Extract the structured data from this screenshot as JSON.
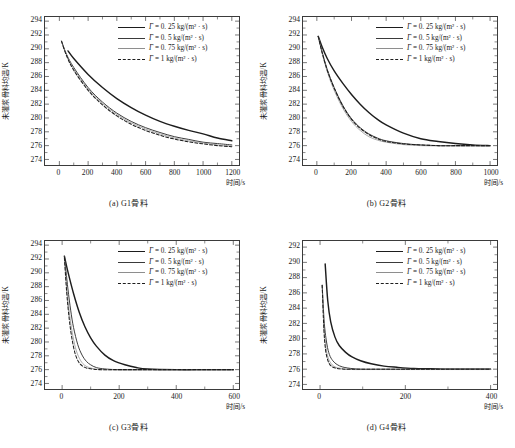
{
  "figure": {
    "y_axis_label": "未灌浆骨料均温/K",
    "x_axis_label": "时间/s",
    "legend_labels": [
      "= 0. 25 kg/(m² · s)",
      "= 0. 5 kg/(m² · s)",
      "= 0. 75 kg/(m² · s)",
      "= 1  kg/(m² · s)"
    ],
    "gamma_symbol": "Γ",
    "series_colors": [
      "#1d1d1d",
      "#3a3a3a",
      "#8e8e8e",
      "#1d1d1d"
    ]
  },
  "chart_data": [
    {
      "type": "line",
      "panel": "a",
      "caption": "(a) G1骨料",
      "xlabel": "时间/s",
      "ylabel": "未灌浆骨料均温/K",
      "xlim": [
        -100,
        1250
      ],
      "ylim": [
        273.2,
        294.6
      ],
      "xticks": [
        0,
        200,
        400,
        600,
        800,
        1000,
        1200
      ],
      "yticks": [
        274,
        276,
        278,
        280,
        282,
        284,
        286,
        288,
        290,
        292,
        294
      ],
      "grid": false,
      "legend_position": "top-right",
      "series": [
        {
          "name": "Γ = 0.25 kg/(m² · s)",
          "style": "solid-thick",
          "color": "#1d1d1d",
          "x": [
            60,
            100,
            200,
            300,
            400,
            500,
            600,
            700,
            800,
            900,
            1000,
            1100,
            1200
          ],
          "y": [
            289.7,
            288.6,
            286.3,
            284.4,
            282.8,
            281.5,
            280.4,
            279.5,
            278.8,
            278.2,
            277.7,
            277.1,
            276.7
          ]
        },
        {
          "name": "Γ = 0.5 kg/(m² · s)",
          "style": "solid-medium",
          "color": "#3a3a3a",
          "x": [
            15,
            50,
            100,
            200,
            300,
            400,
            500,
            600,
            700,
            800,
            900,
            1000,
            1100,
            1200
          ],
          "y": [
            291.1,
            289.2,
            287.3,
            284.4,
            282.3,
            280.7,
            279.5,
            278.6,
            277.9,
            277.3,
            276.9,
            276.5,
            276.3,
            276.1
          ]
        },
        {
          "name": "Γ = 0.75 kg/(m² · s)",
          "style": "solid-thin",
          "color": "#8e8e8e",
          "x": [
            15,
            50,
            100,
            200,
            300,
            400,
            500,
            600,
            700,
            800,
            900,
            1000,
            1100,
            1200
          ],
          "y": [
            291.1,
            289.1,
            287.1,
            284.2,
            282.1,
            280.5,
            279.3,
            278.4,
            277.7,
            277.1,
            276.7,
            276.4,
            276.1,
            275.95
          ]
        },
        {
          "name": "Γ = 1 kg/(m² · s)",
          "style": "dashed",
          "color": "#1d1d1d",
          "x": [
            15,
            50,
            100,
            200,
            300,
            400,
            500,
            600,
            700,
            800,
            900,
            1000,
            1100,
            1200
          ],
          "y": [
            291.1,
            289.0,
            286.9,
            284.0,
            281.9,
            280.3,
            279.1,
            278.2,
            277.5,
            276.95,
            276.55,
            276.25,
            276.0,
            275.85
          ]
        }
      ]
    },
    {
      "type": "line",
      "panel": "b",
      "caption": "(b) G2骨料",
      "xlabel": "时间/s",
      "ylabel": "未灌浆骨料均温/K",
      "xlim": [
        -80,
        1040
      ],
      "ylim": [
        273.2,
        294.6
      ],
      "xticks": [
        0,
        200,
        400,
        600,
        800,
        1000
      ],
      "yticks": [
        274,
        276,
        278,
        280,
        282,
        284,
        286,
        288,
        290,
        292,
        294
      ],
      "grid": false,
      "legend_position": "top-right",
      "series": [
        {
          "name": "Γ = 0.25 kg/(m² · s)",
          "style": "solid-thick",
          "color": "#1d1d1d",
          "x": [
            8,
            30,
            60,
            100,
            150,
            200,
            250,
            300,
            350,
            400,
            500,
            600,
            700,
            800,
            900,
            1000
          ],
          "y": [
            291.8,
            290.3,
            288.6,
            286.8,
            285.0,
            283.4,
            282.0,
            280.8,
            279.8,
            279.0,
            277.8,
            277.0,
            276.6,
            276.3,
            276.1,
            276.0
          ]
        },
        {
          "name": "Γ = 0.5 kg/(m² · s)",
          "style": "solid-medium",
          "color": "#3a3a3a",
          "x": [
            8,
            30,
            60,
            100,
            150,
            200,
            250,
            300,
            350,
            400,
            500,
            600,
            700,
            800,
            900,
            1000
          ],
          "y": [
            291.8,
            289.6,
            287.0,
            284.4,
            281.8,
            279.9,
            278.6,
            277.7,
            277.1,
            276.7,
            276.3,
            276.1,
            276.0,
            276.0,
            276.0,
            276.0
          ]
        },
        {
          "name": "Γ = 0.75 kg/(m² · s)",
          "style": "solid-thin",
          "color": "#8e8e8e",
          "x": [
            8,
            30,
            60,
            100,
            150,
            200,
            250,
            300,
            350,
            400,
            500,
            600,
            700,
            800,
            900,
            1000
          ],
          "y": [
            291.8,
            289.4,
            286.7,
            284.0,
            281.4,
            279.5,
            278.2,
            277.3,
            276.8,
            276.5,
            276.15,
            276.0,
            275.95,
            275.95,
            275.95,
            275.95
          ]
        },
        {
          "name": "Γ = 1 kg/(m² · s)",
          "style": "dashed",
          "color": "#1d1d1d",
          "x": [
            8,
            30,
            60,
            100,
            150,
            200,
            250,
            300,
            350,
            400,
            500,
            600,
            700,
            800,
            900,
            1000
          ],
          "y": [
            291.8,
            289.5,
            286.9,
            284.3,
            281.7,
            279.8,
            278.5,
            277.6,
            277.0,
            276.6,
            276.25,
            276.1,
            276.0,
            276.0,
            276.0,
            276.0
          ]
        }
      ]
    },
    {
      "type": "line",
      "panel": "c",
      "caption": "(c) G3骨料",
      "xlabel": "时间/s",
      "ylabel": "未灌浆骨料均温/K",
      "xlim": [
        -60,
        620
      ],
      "ylim": [
        273.2,
        294.6
      ],
      "xticks": [
        0,
        200,
        400,
        600
      ],
      "yticks": [
        274,
        276,
        278,
        280,
        282,
        284,
        286,
        288,
        290,
        292,
        294
      ],
      "grid": false,
      "legend_position": "top-right",
      "series": [
        {
          "name": "Γ = 0.25 kg/(m² · s)",
          "style": "solid-thick",
          "color": "#1d1d1d",
          "x": [
            8,
            20,
            40,
            60,
            80,
            100,
            120,
            150,
            180,
            220,
            260,
            300,
            400,
            500,
            600
          ],
          "y": [
            292.4,
            290.2,
            287.0,
            284.3,
            282.2,
            280.6,
            279.4,
            278.1,
            277.3,
            276.7,
            276.3,
            276.1,
            276.0,
            276.0,
            276.0
          ]
        },
        {
          "name": "Γ = 0.5 kg/(m² · s)",
          "style": "solid-medium",
          "color": "#3a3a3a",
          "x": [
            8,
            20,
            30,
            40,
            55,
            70,
            85,
            100,
            120,
            150,
            200,
            300,
            400,
            500,
            600
          ],
          "y": [
            292.4,
            287.8,
            284.6,
            282.1,
            279.6,
            278.1,
            277.2,
            276.7,
            276.3,
            276.1,
            276.0,
            276.0,
            276.0,
            276.0,
            276.0
          ]
        },
        {
          "name": "Γ = 0.75 kg/(m² · s)",
          "style": "solid-thin",
          "color": "#8e8e8e",
          "x": [
            8,
            18,
            28,
            38,
            50,
            65,
            80,
            95,
            115,
            140,
            200,
            300,
            400,
            500,
            600
          ],
          "y": [
            292.0,
            287.0,
            283.4,
            280.8,
            278.7,
            277.3,
            276.6,
            276.3,
            276.1,
            276.0,
            275.95,
            275.95,
            275.95,
            275.95,
            275.95
          ]
        },
        {
          "name": "Γ = 1 kg/(m² · s)",
          "style": "dashed",
          "color": "#1d1d1d",
          "x": [
            8,
            16,
            25,
            34,
            45,
            58,
            72,
            88,
            105,
            130,
            180,
            300,
            400,
            500,
            600
          ],
          "y": [
            292.2,
            287.2,
            283.3,
            280.6,
            278.4,
            277.1,
            276.5,
            276.2,
            276.1,
            276.0,
            276.0,
            276.0,
            276.0,
            276.0,
            276.0
          ]
        }
      ]
    },
    {
      "type": "line",
      "panel": "d",
      "caption": "(d) G4骨料",
      "xlabel": "时间/s",
      "ylabel": "未灌浆骨料均温/K",
      "xlim": [
        -40,
        415
      ],
      "ylim": [
        273.4,
        292.8
      ],
      "xticks": [
        0,
        200,
        400
      ],
      "yticks": [
        274,
        276,
        278,
        280,
        282,
        284,
        286,
        288,
        290,
        292
      ],
      "grid": false,
      "legend_position": "top-right",
      "series": [
        {
          "name": "Γ = 0.25 kg/(m² · s)",
          "style": "solid-thick",
          "color": "#1d1d1d",
          "x": [
            12,
            18,
            25,
            35,
            45,
            60,
            75,
            95,
            120,
            150,
            180,
            220,
            260,
            300,
            350,
            400
          ],
          "y": [
            289.8,
            285.0,
            282.2,
            280.2,
            279.1,
            278.2,
            277.6,
            277.1,
            276.7,
            276.4,
            276.25,
            276.1,
            276.05,
            276.0,
            276.0,
            276.0
          ]
        },
        {
          "name": "Γ = 0.5 kg/(m² · s)",
          "style": "solid-medium",
          "color": "#3a3a3a",
          "x": [
            5,
            10,
            16,
            22,
            30,
            40,
            52,
            65,
            80,
            100,
            130,
            170,
            220,
            300,
            400
          ],
          "y": [
            287.0,
            282.0,
            279.3,
            277.9,
            277.1,
            276.6,
            276.3,
            276.15,
            276.05,
            276.0,
            276.0,
            276.0,
            276.0,
            276.0,
            276.0
          ]
        },
        {
          "name": "Γ = 0.75 kg/(m² · s)",
          "style": "solid-thin",
          "color": "#8e8e8e",
          "x": [
            5,
            9,
            14,
            19,
            25,
            32,
            40,
            50,
            62,
            78,
            100,
            140,
            200,
            300,
            400
          ],
          "y": [
            287.0,
            281.6,
            278.8,
            277.5,
            276.8,
            276.4,
            276.2,
            276.1,
            276.0,
            275.95,
            275.95,
            275.95,
            275.95,
            275.95,
            275.95
          ]
        },
        {
          "name": "Γ = 1 kg/(m² · s)",
          "style": "dashed",
          "color": "#1d1d1d",
          "x": [
            5,
            9,
            13,
            18,
            23,
            29,
            36,
            45,
            56,
            70,
            90,
            130,
            200,
            300,
            400
          ],
          "y": [
            287.0,
            281.2,
            278.5,
            277.2,
            276.6,
            276.3,
            276.15,
            276.05,
            276.0,
            276.0,
            276.0,
            276.0,
            276.0,
            276.0,
            276.0
          ]
        }
      ]
    }
  ]
}
